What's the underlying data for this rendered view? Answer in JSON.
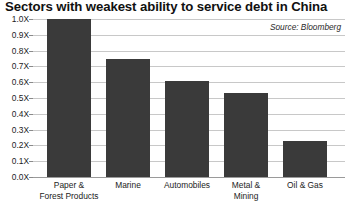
{
  "chart_data": {
    "type": "bar",
    "title": "Sectors with weakest ability to service debt in China",
    "source": "Source: Bloomberg",
    "xlabel": "",
    "ylabel": "",
    "ylim": [
      0,
      1.0
    ],
    "grid": true,
    "legend": "none",
    "categories": [
      "Paper &\nForest Products",
      "Marine",
      "Automobiles",
      "Metal &\nMining",
      "Oil & Gas"
    ],
    "values": [
      1.0,
      0.75,
      0.61,
      0.53,
      0.23
    ],
    "ytick_labels": [
      "1.0X",
      "0.9X",
      "0.8X",
      "0.7X",
      "0.6X",
      "0.5X",
      "0.4X",
      "0.3X",
      "0.2X",
      "0.1X",
      "0.0X"
    ],
    "ytick_values": [
      1.0,
      0.9,
      0.8,
      0.7,
      0.6,
      0.5,
      0.4,
      0.3,
      0.2,
      0.1,
      0.0
    ],
    "colors": {
      "bar": "#3a3a3a",
      "grid": "#c8c8c8",
      "axis": "#9a9a9a",
      "text": "#1c1c1c",
      "background": "#ffffff"
    }
  }
}
